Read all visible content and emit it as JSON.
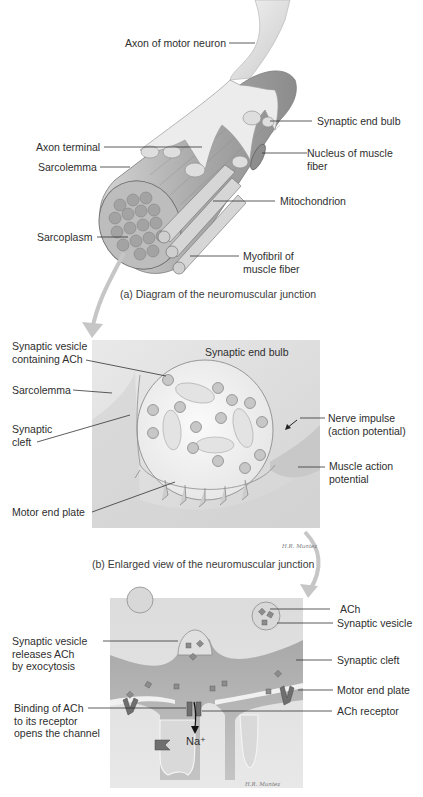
{
  "figure": {
    "panel_a": {
      "caption": "(a) Diagram of the neuromuscular junction",
      "labels": {
        "axon_motor_neuron": "Axon of motor neuron",
        "synaptic_end_bulb": "Synaptic end bulb",
        "axon_terminal": "Axon terminal",
        "nucleus_line1": "Nucleus of muscle",
        "nucleus_line2": "fiber",
        "sarcolemma": "Sarcolemma",
        "mitochondrion": "Mitochondrion",
        "sarcoplasm": "Sarcoplasm",
        "myofibril_line1": "Myofibril of",
        "myofibril_line2": "muscle fiber"
      }
    },
    "panel_b": {
      "caption": "(b) Enlarged view of the neuromuscular junction",
      "signature": "H.R. Muntez",
      "labels": {
        "vesicle_line1": "Synaptic vesicle",
        "vesicle_line2": "containing ACh",
        "end_bulb": "Synaptic end bulb",
        "sarcolemma": "Sarcolemma",
        "cleft_line1": "Synaptic",
        "cleft_line2": "cleft",
        "impulse_line1": "Nerve impulse",
        "impulse_line2": "(action potential)",
        "map_line1": "Muscle action",
        "map_line2": "potential",
        "motor_end_plate": "Motor end plate"
      }
    },
    "panel_c": {
      "signature": "H.R. Muntez",
      "ion": "Na⁺",
      "labels": {
        "ach": "ACh",
        "synaptic_vesicle": "Synaptic vesicle",
        "release_line1": "Synaptic vesicle",
        "release_line2": "releases ACh",
        "release_line3": "by exocytosis",
        "synaptic_cleft": "Synaptic cleft",
        "motor_end_plate": "Motor end plate",
        "binding_line1": "Binding of ACh",
        "binding_line2": "to its receptor",
        "binding_line3": "opens the channel",
        "ach_receptor": "ACh receptor"
      }
    }
  }
}
